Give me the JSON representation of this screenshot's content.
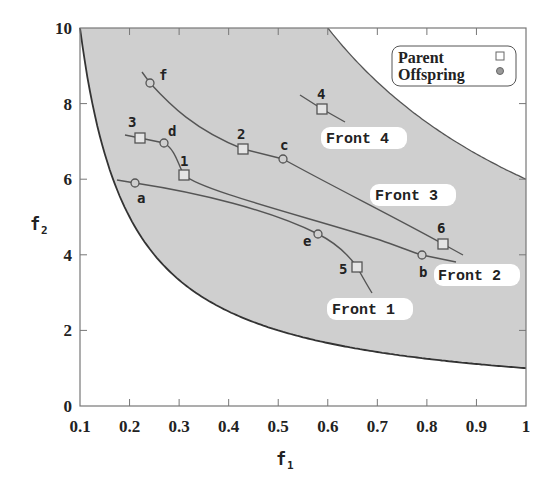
{
  "chart_data": {
    "type": "scatter",
    "title": "",
    "xlabel": "f1",
    "ylabel": "f2",
    "xlim": [
      0.1,
      1.0
    ],
    "ylim": [
      0,
      10
    ],
    "xticks": [
      "0.1",
      "0.2",
      "0.3",
      "0.4",
      "0.5",
      "0.6",
      "0.7",
      "0.8",
      "0.9",
      "1"
    ],
    "yticks": [
      "0",
      "2",
      "4",
      "6",
      "8",
      "10"
    ],
    "grid": false,
    "legend_position": "top-right",
    "legend": [
      {
        "label": "Parent",
        "marker": "square"
      },
      {
        "label": "Offspring",
        "marker": "circle"
      }
    ],
    "feasible_region": {
      "lower_boundary": "f2 = 1/f1",
      "upper_boundary": "f2 = 6/f1",
      "fill_color": "#cfcfcf"
    },
    "points": [
      {
        "label": "1",
        "type": "Parent",
        "f1": 0.31,
        "f2": 6.1
      },
      {
        "label": "2",
        "type": "Parent",
        "f1": 0.43,
        "f2": 6.8
      },
      {
        "label": "3",
        "type": "Parent",
        "f1": 0.22,
        "f2": 7.1
      },
      {
        "label": "4",
        "type": "Parent",
        "f1": 0.59,
        "f2": 7.9
      },
      {
        "label": "5",
        "type": "Parent",
        "f1": 0.66,
        "f2": 3.65
      },
      {
        "label": "6",
        "type": "Parent",
        "f1": 0.83,
        "f2": 4.25
      },
      {
        "label": "a",
        "type": "Offspring",
        "f1": 0.21,
        "f2": 5.9
      },
      {
        "label": "b",
        "type": "Offspring",
        "f1": 0.79,
        "f2": 4.0
      },
      {
        "label": "c",
        "type": "Offspring",
        "f1": 0.51,
        "f2": 6.5
      },
      {
        "label": "d",
        "type": "Offspring",
        "f1": 0.27,
        "f2": 6.9
      },
      {
        "label": "e",
        "type": "Offspring",
        "f1": 0.58,
        "f2": 4.5
      },
      {
        "label": "f",
        "type": "Offspring",
        "f1": 0.24,
        "f2": 8.5
      }
    ],
    "fronts": [
      {
        "name": "Front 1",
        "members": [
          "a",
          "e",
          "5"
        ]
      },
      {
        "name": "Front 2",
        "members": [
          "3",
          "d",
          "1",
          "b"
        ]
      },
      {
        "name": "Front 3",
        "members": [
          "f",
          "2",
          "c",
          "6"
        ]
      },
      {
        "name": "Front 4",
        "members": [
          "4"
        ]
      }
    ]
  },
  "labels": {
    "x_axis": "f",
    "x_axis_sub": "1",
    "y_axis": "f",
    "y_axis_sub": "2",
    "legend_parent": "Parent",
    "legend_offspring": "Offspring",
    "front1": "Front 1",
    "front2": "Front 2",
    "front3": "Front 3",
    "front4": "Front 4",
    "pt_1": "1",
    "pt_2": "2",
    "pt_3": "3",
    "pt_4": "4",
    "pt_5": "5",
    "pt_6": "6",
    "pt_a": "a",
    "pt_b": "b",
    "pt_c": "c",
    "pt_d": "d",
    "pt_e": "e",
    "pt_f": "f",
    "xt": [
      "0.1",
      "0.2",
      "0.3",
      "0.4",
      "0.5",
      "0.6",
      "0.7",
      "0.8",
      "0.9",
      "1"
    ],
    "yt": [
      "0",
      "2",
      "4",
      "6",
      "8",
      "10"
    ]
  }
}
